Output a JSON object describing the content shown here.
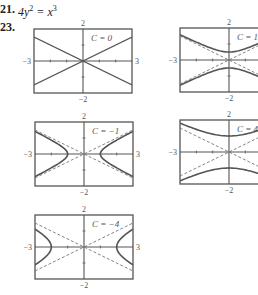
{
  "header": {
    "problem_21_number": "21.",
    "problem_21_lhs": "4y",
    "problem_21_lhs_exp": "2",
    "problem_21_op": " = x",
    "problem_21_rhs_exp": "3",
    "problem_23_number": "23."
  },
  "colors": {
    "frame": "#555555",
    "curve": "#555555",
    "asymptote": "#777777",
    "text": "#222222"
  },
  "chart_data": [
    {
      "type": "line",
      "title": "C = 0",
      "equation": "4y^2 - x^2 = C",
      "xlim": [
        -3,
        3
      ],
      "ylim": [
        -2,
        2
      ],
      "tick_labels": {
        "xmin": "-3",
        "xmax": "3",
        "ymin": "-2",
        "ymax": "2"
      },
      "series": [
        {
          "name": "y = x/2",
          "style": "solid",
          "x": [
            -3,
            3
          ],
          "y": [
            -1.5,
            1.5
          ]
        },
        {
          "name": "y = -x/2",
          "style": "solid",
          "x": [
            -3,
            3
          ],
          "y": [
            1.5,
            -1.5
          ]
        }
      ]
    },
    {
      "type": "line",
      "title": "C = 1",
      "equation": "4y^2 - x^2 = 1",
      "xlim": [
        -3,
        3
      ],
      "ylim": [
        -2,
        2
      ],
      "tick_labels": {
        "xmin": "-3",
        "xmax": "3",
        "ymin": "-2",
        "ymax": "2"
      },
      "series": [
        {
          "name": "upper branch",
          "style": "solid",
          "vertex": [
            0,
            0.5
          ]
        },
        {
          "name": "lower branch",
          "style": "solid",
          "vertex": [
            0,
            -0.5
          ]
        },
        {
          "name": "asymptotes y = ±x/2",
          "style": "dashed"
        }
      ]
    },
    {
      "type": "line",
      "title": "C = -1",
      "equation": "4y^2 - x^2 = -1",
      "xlim": [
        -3,
        3
      ],
      "ylim": [
        -2,
        2
      ],
      "tick_labels": {
        "xmin": "-3",
        "xmax": "3",
        "ymin": "-2",
        "ymax": "2"
      },
      "series": [
        {
          "name": "right branch",
          "style": "solid",
          "vertex": [
            1,
            0
          ]
        },
        {
          "name": "left branch",
          "style": "solid",
          "vertex": [
            -1,
            0
          ]
        },
        {
          "name": "asymptotes y = ±x/2",
          "style": "dashed"
        }
      ]
    },
    {
      "type": "line",
      "title": "C = 4",
      "equation": "4y^2 - x^2 = 4",
      "xlim": [
        -3,
        3
      ],
      "ylim": [
        -2,
        2
      ],
      "tick_labels": {
        "xmin": "-3",
        "xmax": "3",
        "ymin": "-2",
        "ymax": "2"
      },
      "series": [
        {
          "name": "upper branch",
          "style": "solid",
          "vertex": [
            0,
            1
          ]
        },
        {
          "name": "lower branch",
          "style": "solid",
          "vertex": [
            0,
            -1
          ]
        },
        {
          "name": "asymptotes y = ±x/2",
          "style": "dashed"
        }
      ]
    },
    {
      "type": "line",
      "title": "C = -4",
      "equation": "4y^2 - x^2 = -4",
      "xlim": [
        -3,
        3
      ],
      "ylim": [
        -2,
        2
      ],
      "tick_labels": {
        "xmin": "-3",
        "xmax": "3",
        "ymin": "-2",
        "ymax": "2"
      },
      "series": [
        {
          "name": "right branch",
          "style": "solid",
          "vertex": [
            2,
            0
          ]
        },
        {
          "name": "left branch",
          "style": "solid",
          "vertex": [
            -2,
            0
          ]
        },
        {
          "name": "asymptotes y = ±x/2",
          "style": "dashed"
        }
      ]
    }
  ],
  "plots": [
    {
      "id": "c0",
      "label": "C = 0",
      "C": 0,
      "left": 34,
      "top": 29,
      "ymax": "2",
      "ymin": "-2",
      "xmin": "-3",
      "xmax": "3"
    },
    {
      "id": "c1",
      "label": "C = 1",
      "C": 1,
      "left": 180,
      "top": 28,
      "ymax": "2",
      "ymin": "-2",
      "xmin": "-3",
      "xmax": "3"
    },
    {
      "id": "cm1",
      "label": "C = −1",
      "C": -1,
      "left": 35,
      "top": 122,
      "ymax": "2",
      "ymin": "-2",
      "xmin": "-3",
      "xmax": "3"
    },
    {
      "id": "c4",
      "label": "C = 4",
      "C": 4,
      "left": 180,
      "top": 120,
      "ymax": "2",
      "ymin": "-2",
      "xmin": "-3",
      "xmax": "3"
    },
    {
      "id": "cm4",
      "label": "C = −4",
      "C": -4,
      "left": 35,
      "top": 215,
      "ymax": "2",
      "ymin": "-2",
      "xmin": "-3",
      "xmax": "3"
    }
  ]
}
